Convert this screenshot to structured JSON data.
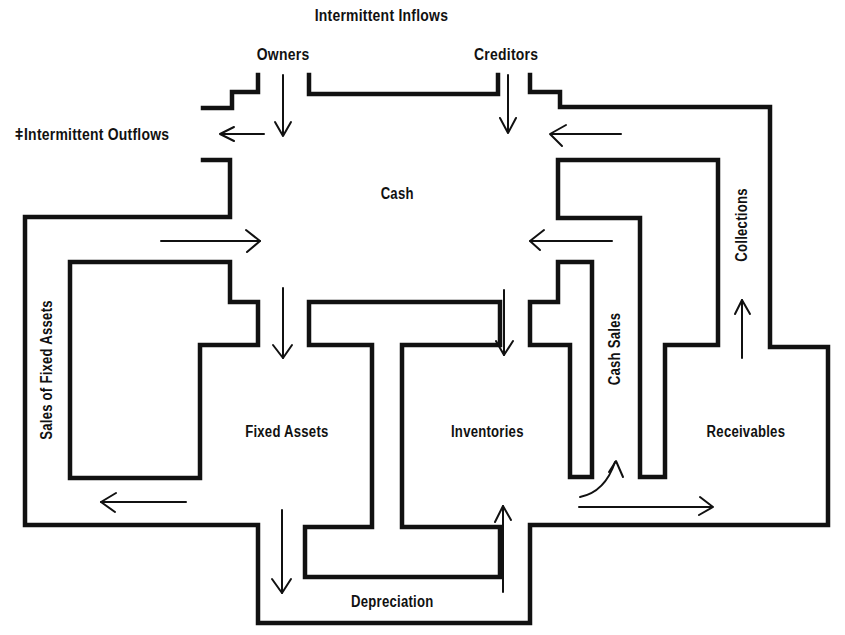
{
  "diagram": {
    "title": "Intermittent Inflows",
    "sources": {
      "owners": "Owners",
      "creditors": "Creditors"
    },
    "outflow": {
      "marker": "ǂ",
      "label": "Intermittent Outflows"
    },
    "nodes": {
      "cash": "Cash",
      "fixed_assets": "Fixed Assets",
      "inventories": "Inventories",
      "receivables": "Receivables"
    },
    "channels": {
      "sales_of_fixed_assets": "Sales of Fixed Assets",
      "cash_sales": "Cash Sales",
      "collections": "Collections",
      "depreciation": "Depreciation"
    },
    "colors": {
      "ink": "#111111",
      "background": "#ffffff"
    }
  }
}
